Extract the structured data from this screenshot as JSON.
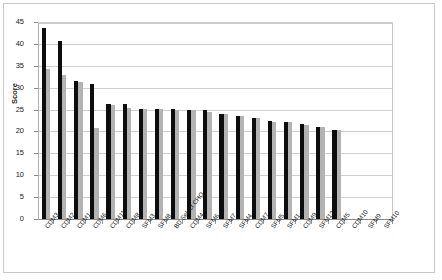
{
  "chart_data": {
    "type": "bar",
    "title": "",
    "xlabel": "",
    "ylabel": "Score",
    "ylim": [
      0,
      45
    ],
    "yticks": [
      0,
      5,
      10,
      15,
      20,
      25,
      30,
      35,
      40,
      45
    ],
    "grid": true,
    "legend": "none",
    "categories": [
      "CDM3",
      "CDM2",
      "CDM1",
      "CDM6",
      "CDM11",
      "CDM8",
      "SFM3",
      "SFM8",
      "BD Select CHO",
      "CDM4",
      "SFM6",
      "SFM7",
      "SFM4",
      "CDM7",
      "SFM5",
      "SFM1",
      "CDM9",
      "SFM12",
      "CDM5",
      "CDM10",
      "SFM9",
      "SFM10"
    ],
    "series": [
      {
        "name": "series-1",
        "color": "#0d0d0d",
        "values": [
          43.8,
          41.0,
          31.8,
          31.0,
          26.4,
          26.4,
          25.4,
          25.4,
          25.3,
          25.2,
          25.1,
          24.3,
          23.8,
          23.3,
          22.6,
          22.4,
          21.9,
          21.3,
          20.6,
          0,
          0,
          0
        ]
      },
      {
        "name": "series-2",
        "color": "#b3b3b3",
        "values": [
          34.6,
          33.2,
          31.6,
          21.0,
          26.3,
          25.6,
          25.3,
          25.3,
          25.2,
          25.1,
          24.6,
          24.2,
          23.7,
          23.2,
          22.5,
          22.3,
          21.8,
          21.2,
          20.5,
          0,
          0,
          0
        ]
      }
    ]
  },
  "axis": {
    "y_tick_labels": [
      "45",
      "40",
      "35",
      "30",
      "25",
      "20",
      "15",
      "10",
      "5",
      "0"
    ]
  }
}
